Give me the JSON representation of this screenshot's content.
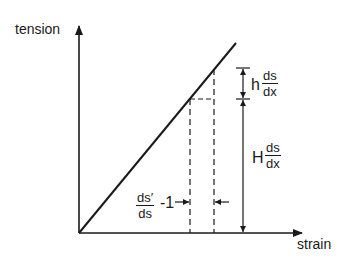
{
  "diagram": {
    "y_axis_label": "tension",
    "x_axis_label": "strain",
    "annotations": {
      "h_prefix": "h",
      "H_prefix": "H",
      "ds_numerator": "ds",
      "dx_denominator": "dx",
      "strain_num": "ds′",
      "strain_den": "ds",
      "strain_suffix": "-1"
    }
  }
}
